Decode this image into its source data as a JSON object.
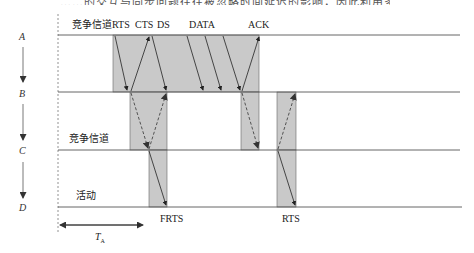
{
  "figure": {
    "top_text_cut": "……的交互与同步问题往往被忽略时间延迟的影响，因此利用多跳信道，在部分是依照组织……",
    "nodes": [
      "A",
      "B",
      "C",
      "D"
    ],
    "line_labels": {
      "contention_top": "竞争信道",
      "contention_mid": "竞争信道",
      "active": "活动"
    },
    "packet_labels": {
      "rts": "RTS",
      "cts": "CTS",
      "ds": "DS",
      "data": "DATA",
      "ack": "ACK",
      "frts": "FRTS",
      "rts_bottom": "RTS"
    },
    "timing_label": "T",
    "timing_subscript": "A",
    "colors": {
      "shade": "#c8c8c8",
      "line": "#444444",
      "arrow": "#222222"
    }
  }
}
